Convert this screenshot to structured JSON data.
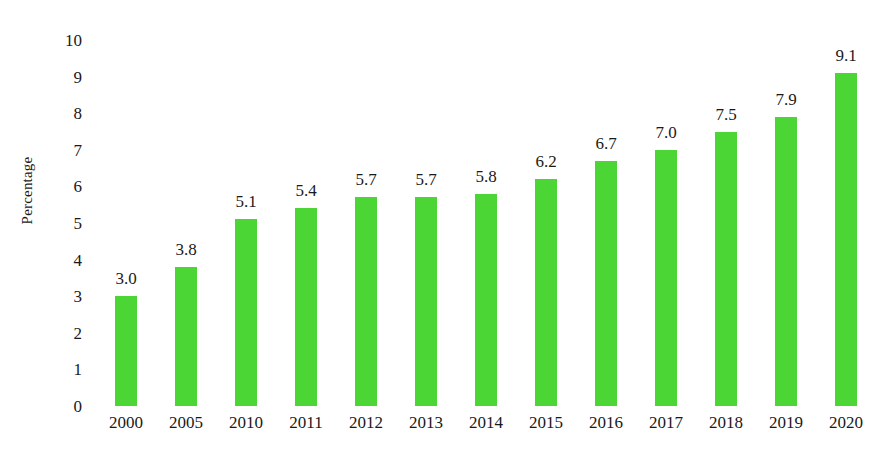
{
  "chart_data": {
    "type": "bar",
    "title": "",
    "subtitle": "",
    "xlabel": "",
    "ylabel": "Percentage",
    "categories": [
      "2000",
      "2005",
      "2010",
      "2011",
      "2012",
      "2013",
      "2014",
      "2015",
      "2016",
      "2017",
      "2018",
      "2019",
      "2020"
    ],
    "values": [
      3.0,
      3.8,
      5.1,
      5.4,
      5.7,
      5.7,
      5.8,
      6.2,
      6.7,
      7.0,
      7.5,
      7.9,
      9.1
    ],
    "data_labels": [
      "3.0",
      "3.8",
      "5.1",
      "5.4",
      "5.7",
      "5.7",
      "5.8",
      "6.2",
      "6.7",
      "7.0",
      "7.5",
      "7.9",
      "9.1"
    ],
    "ylim": [
      0,
      10
    ],
    "ytick_step": 1,
    "ytick_labels": [
      "10",
      "9",
      "8",
      "7",
      "6",
      "5",
      "4",
      "3",
      "2",
      "1",
      "0"
    ],
    "grid": false,
    "axis_lines": false,
    "legend": null,
    "legend_position": "none",
    "bar_color": "#4CD635",
    "text_color": "#1a1a1a",
    "background_color": "#ffffff",
    "annotations": []
  }
}
